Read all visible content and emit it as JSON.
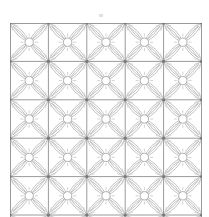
{
  "image": {
    "description": "Tiled geometric line pattern: square grid of four-petal floral motifs",
    "grid": {
      "columns": 5,
      "rows": 5,
      "tile_size_px": 38.4
    },
    "colors": {
      "background": "#ffffff",
      "grid_line": "#9a9a9a",
      "motif_line": "#b4b4b4",
      "node": "#7a7a7a"
    },
    "motif": "four-petal-flower-with-center-circle"
  }
}
